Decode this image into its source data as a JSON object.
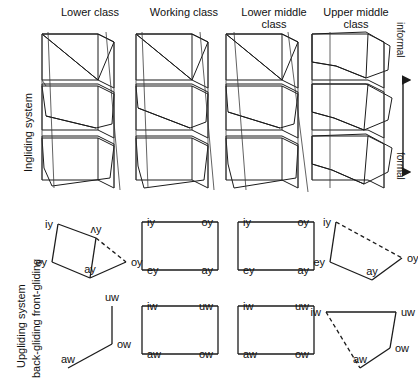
{
  "figure": {
    "columns": [
      {
        "id": "lower-class",
        "label_line1": "Lower class",
        "label_line2": ""
      },
      {
        "id": "working-class",
        "label_line1": "Working class",
        "label_line2": ""
      },
      {
        "id": "lower-middle-class",
        "label_line1": "Lower middle",
        "label_line2": "class"
      },
      {
        "id": "upper-middle-class",
        "label_line1": "Upper middle",
        "label_line2": "class"
      }
    ],
    "row_labels": {
      "top": "Ingliding system",
      "bottom_line1": "Upgliding system",
      "bottom_line2": "back-gliding front-gliding"
    },
    "style_axis": {
      "top": "informal",
      "bottom": "formal",
      "arrow": "double-headed-vertical-arrow"
    }
  },
  "ingliding": {
    "type": "stacked-prism",
    "layers": 3,
    "note": "three stacked 3-D boxes with hatched sub-regions",
    "columns": [
      {
        "id": "lower-class",
        "hatch_style": "coarse-diagonal",
        "shape": "narrow-prism"
      },
      {
        "id": "working-class",
        "hatch_style": "coarse-diagonal",
        "shape": "narrow-prism"
      },
      {
        "id": "lower-middle-class",
        "hatch_style": "coarse-diagonal",
        "shape": "narrow-prism"
      },
      {
        "id": "upper-middle-class",
        "hatch_style": "fine-diagonal",
        "shape": "wide-prism"
      }
    ]
  },
  "upgliding": {
    "front_gliding": {
      "row_name": "front-gliding",
      "glide": "y",
      "columns": [
        {
          "id": "lower-class",
          "shape": "chevron",
          "vertices": [
            {
              "label": "iy",
              "x": 14,
              "y": 12,
              "anchor": "end"
            },
            {
              "label": "ey",
              "x": 8,
              "y": 50,
              "anchor": "end"
            },
            {
              "label": "ay",
              "x": 46,
              "y": 66,
              "anchor": "middle"
            },
            {
              "label": "oy",
              "x": 82,
              "y": 50,
              "anchor": "start"
            },
            {
              "label": "ʌy",
              "x": 52,
              "y": 26,
              "anchor": "middle"
            }
          ],
          "solid_edges": [
            [
              0,
              1
            ],
            [
              1,
              2
            ],
            [
              2,
              3
            ],
            [
              0,
              4
            ],
            [
              4,
              2
            ]
          ],
          "dashed_edges": [
            [
              4,
              3
            ]
          ]
        },
        {
          "id": "working-class",
          "shape": "rectangle",
          "vertices": [
            {
              "label": "iy",
              "x": 10,
              "y": 10,
              "anchor": "start"
            },
            {
              "label": "oy",
              "x": 86,
              "y": 10,
              "anchor": "end"
            },
            {
              "label": "ay",
              "x": 86,
              "y": 58,
              "anchor": "end"
            },
            {
              "label": "ey",
              "x": 10,
              "y": 58,
              "anchor": "start"
            }
          ],
          "solid_edges": [
            [
              0,
              1
            ],
            [
              1,
              2
            ],
            [
              2,
              3
            ],
            [
              3,
              0
            ]
          ],
          "dashed_edges": []
        },
        {
          "id": "lower-middle-class",
          "shape": "rectangle",
          "vertices": [
            {
              "label": "iy",
              "x": 10,
              "y": 10,
              "anchor": "start"
            },
            {
              "label": "oy",
              "x": 86,
              "y": 10,
              "anchor": "end"
            },
            {
              "label": "ay",
              "x": 86,
              "y": 58,
              "anchor": "end"
            },
            {
              "label": "ey",
              "x": 10,
              "y": 58,
              "anchor": "start"
            }
          ],
          "solid_edges": [
            [
              0,
              1
            ],
            [
              1,
              2
            ],
            [
              2,
              3
            ],
            [
              3,
              0
            ]
          ],
          "dashed_edges": []
        },
        {
          "id": "upper-middle-class",
          "shape": "slanted-quadrilateral",
          "vertices": [
            {
              "label": "iy",
              "x": 14,
              "y": 12,
              "anchor": "end"
            },
            {
              "label": "ey",
              "x": 8,
              "y": 52,
              "anchor": "end"
            },
            {
              "label": "ay",
              "x": 50,
              "y": 70,
              "anchor": "middle"
            },
            {
              "label": "oy",
              "x": 80,
              "y": 48,
              "anchor": "start"
            }
          ],
          "solid_edges": [
            [
              0,
              1
            ],
            [
              1,
              2
            ],
            [
              2,
              3
            ]
          ],
          "dashed_edges": [
            [
              0,
              3
            ]
          ]
        }
      ]
    },
    "back_gliding": {
      "row_name": "back-gliding",
      "glide": "w",
      "columns": [
        {
          "id": "lower-class",
          "shape": "bent-line",
          "vertices": [
            {
              "label": "uw",
              "x": 56,
              "y": 10,
              "anchor": "middle"
            },
            {
              "label": "ow",
              "x": 56,
              "y": 48,
              "anchor": "start"
            },
            {
              "label": "aw",
              "x": 12,
              "y": 72,
              "anchor": "middle"
            }
          ],
          "solid_edges": [
            [
              0,
              1
            ],
            [
              1,
              2
            ]
          ],
          "dashed_edges": []
        },
        {
          "id": "working-class",
          "shape": "rectangle",
          "vertices": [
            {
              "label": "iw",
              "x": 10,
              "y": 10,
              "anchor": "start"
            },
            {
              "label": "uw",
              "x": 86,
              "y": 10,
              "anchor": "end"
            },
            {
              "label": "ow",
              "x": 86,
              "y": 58,
              "anchor": "end"
            },
            {
              "label": "aw",
              "x": 10,
              "y": 58,
              "anchor": "start"
            }
          ],
          "solid_edges": [
            [
              0,
              1
            ],
            [
              1,
              2
            ],
            [
              2,
              3
            ],
            [
              3,
              0
            ]
          ],
          "dashed_edges": []
        },
        {
          "id": "lower-middle-class",
          "shape": "rectangle",
          "vertices": [
            {
              "label": "iw",
              "x": 10,
              "y": 10,
              "anchor": "start"
            },
            {
              "label": "uw",
              "x": 86,
              "y": 10,
              "anchor": "end"
            },
            {
              "label": "ow",
              "x": 86,
              "y": 58,
              "anchor": "end"
            },
            {
              "label": "aw",
              "x": 10,
              "y": 58,
              "anchor": "start"
            }
          ],
          "solid_edges": [
            [
              0,
              1
            ],
            [
              1,
              2
            ],
            [
              2,
              3
            ],
            [
              3,
              0
            ]
          ],
          "dashed_edges": []
        },
        {
          "id": "upper-middle-class",
          "shape": "open-quadrilateral",
          "vertices": [
            {
              "label": "iw",
              "x": 8,
              "y": 16,
              "anchor": "end"
            },
            {
              "label": "uw",
              "x": 78,
              "y": 16,
              "anchor": "start"
            },
            {
              "label": "ow",
              "x": 72,
              "y": 52,
              "anchor": "start"
            },
            {
              "label": "aw",
              "x": 42,
              "y": 72,
              "anchor": "middle"
            }
          ],
          "solid_edges": [
            [
              0,
              1
            ],
            [
              1,
              2
            ],
            [
              2,
              3
            ]
          ],
          "dashed_edges": [
            [
              0,
              3
            ]
          ]
        }
      ]
    }
  },
  "colors": {
    "ink": "#1b1b1b",
    "hatch": "#1b1b1b",
    "background": "#ffffff",
    "rule": "#9a9a9a"
  }
}
